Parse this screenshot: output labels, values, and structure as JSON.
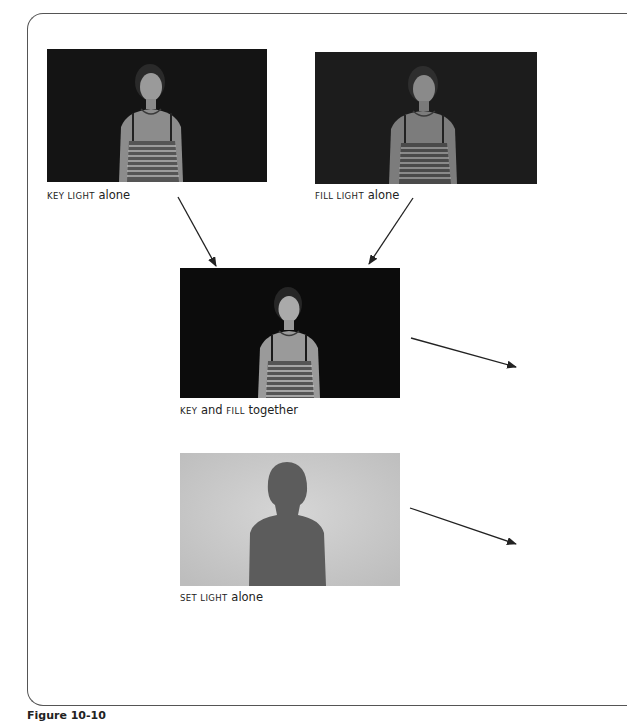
{
  "figure": {
    "label": "Figure 10-10",
    "panels": [
      {
        "id": "key",
        "caption_sc": "KEY LIGHT",
        "caption_rest": " alone",
        "background": "#141414",
        "subject_tone": "#8a8a8a"
      },
      {
        "id": "fill",
        "caption_sc": "FILL LIGHT",
        "caption_rest": " alone",
        "background": "#1a1a1a",
        "subject_tone": "#7a7a7a"
      },
      {
        "id": "key-fill",
        "caption_sc1": "KEY",
        "caption_mid": " and ",
        "caption_sc2": "FILL",
        "caption_rest": " together",
        "background": "#0c0c0c",
        "subject_tone": "#9a9a9a"
      },
      {
        "id": "set",
        "caption_sc": "SET LIGHT",
        "caption_rest": " alone",
        "background": "#c8c8c8",
        "subject_tone": "#5a5a5a"
      }
    ],
    "arrow_color": "#222222"
  }
}
